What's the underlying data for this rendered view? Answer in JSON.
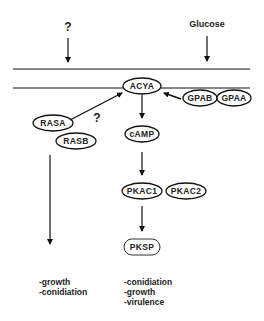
{
  "diagram": {
    "signals": {
      "unknown_top": "?",
      "glucose": "Glucose",
      "unknown_ras": "?"
    },
    "nodes": {
      "acya": "ACYA",
      "gpab": "GPAB",
      "gpaa": "GPAA",
      "rasa": "RASA",
      "rasb": "RASB",
      "camp": "cAMP",
      "pkac1": "PKAC1",
      "pkac2": "PKAC2",
      "pksp": "PKSP"
    },
    "outputs": {
      "ras_pathway": [
        "-growth",
        "-conidiation"
      ],
      "camp_pathway": [
        "-conidiation",
        "-growth",
        "-virulence"
      ]
    },
    "colors": {
      "stroke": "#111111",
      "text": "#222222",
      "background": "#ffffff"
    }
  }
}
